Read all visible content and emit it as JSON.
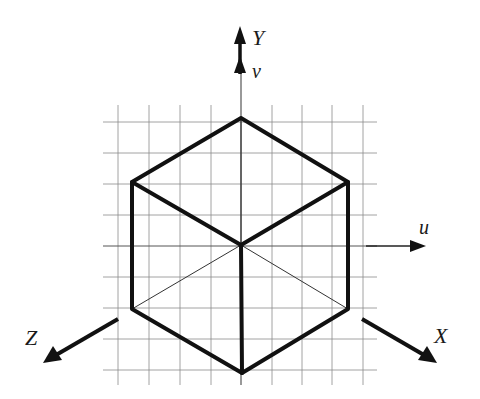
{
  "diagram": {
    "colors": {
      "background": "#ffffff",
      "grid": "#8a8a8a",
      "cube_edge": "#111111",
      "axis": "#111111",
      "thin_line": "#333333"
    },
    "grid": {
      "x_min": 103,
      "x_max": 377,
      "y_min": 105,
      "y_max": 385,
      "vertical_lines": [
        118,
        149,
        180,
        211,
        242,
        272,
        302,
        332,
        363
      ],
      "horizontal_lines": [
        122,
        153,
        184,
        215,
        246,
        277,
        308,
        339,
        370
      ]
    },
    "axes": {
      "Y": {
        "label": "Y",
        "label_x": 252,
        "label_y": 45
      },
      "v": {
        "label": "v",
        "label_x": 252,
        "label_y": 78
      },
      "u": {
        "label": "u",
        "label_x": 419,
        "label_y": 234
      },
      "Z": {
        "label": "Z",
        "label_x": 25,
        "label_y": 345
      },
      "X": {
        "label": "X",
        "label_x": 434,
        "label_y": 343
      }
    },
    "cube": {
      "vertices": {
        "top": [
          241,
          118
        ],
        "upper_left": [
          132,
          182
        ],
        "upper_right": [
          348,
          182
        ],
        "center": [
          241,
          245
        ],
        "lower_left": [
          132,
          309
        ],
        "lower_right": [
          348,
          309
        ],
        "bottom": [
          242,
          373
        ]
      }
    }
  }
}
